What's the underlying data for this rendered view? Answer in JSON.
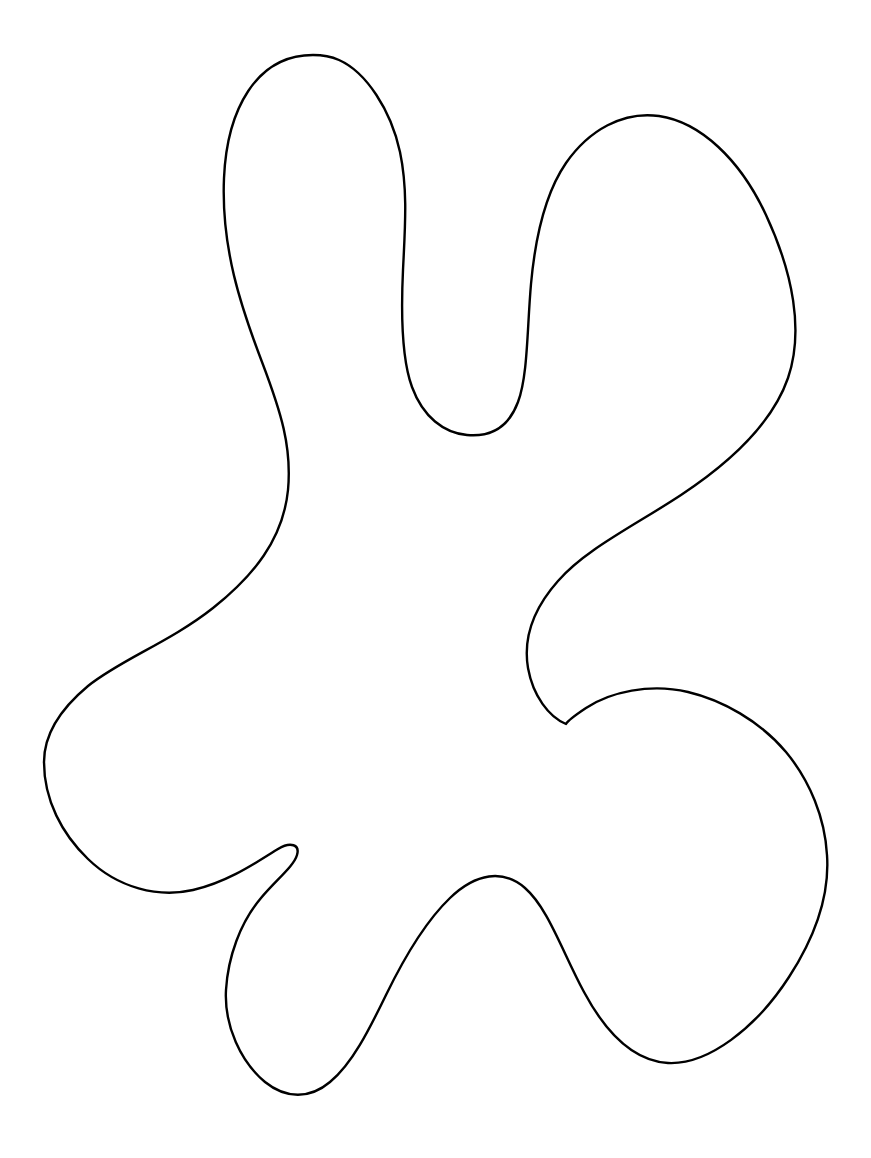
{
  "canvas": {
    "width": 871,
    "height": 1158,
    "background_color": "#ffffff",
    "title": "Blob Outline"
  },
  "artwork": {
    "name": "amoeba-blob-outline",
    "description": "Single closed freeform blob / splat outline drawing",
    "stroke_color": "#000000",
    "fill_color": "#ffffff",
    "stroke_width": 2.4,
    "shape_type": "closed-freeform-curve",
    "lobe_count": 5,
    "notch_count": 4,
    "bounding_box": {
      "x": 44,
      "y": 53,
      "width": 785,
      "height": 1045
    },
    "features": [
      {
        "name": "top-lobe",
        "kind": "lobe",
        "apex_x": 313,
        "apex_y": 55
      },
      {
        "name": "upper-right-lobe",
        "kind": "lobe",
        "apex_x": 630,
        "apex_y": 118
      },
      {
        "name": "central-notch",
        "kind": "notch",
        "apex_x": 467,
        "apex_y": 435
      },
      {
        "name": "right-middle-notch",
        "kind": "notch",
        "apex_x": 566,
        "apex_y": 724
      },
      {
        "name": "bottom-right-lobe",
        "kind": "lobe",
        "apex_x": 827,
        "apex_y": 855
      },
      {
        "name": "bottom-left-lobe",
        "kind": "lobe",
        "apex_x": 288,
        "apex_y": 1096
      },
      {
        "name": "narrow-hook-spike",
        "kind": "notch",
        "apex_x": 296,
        "apex_y": 849
      },
      {
        "name": "left-lobe",
        "kind": "lobe",
        "apex_x": 44,
        "apex_y": 762
      }
    ],
    "path_d": "M 313 55 C 256 55 227 110 224 178 C 221 248 241 307 262 362 C 281 412 292 447 288 490 C 283 540 253 576 213 608 C 170 642 120 660 88 686 C 52 716 44 742 44 762 C 44 800 62 834 88 859 C 118 888 158 898 193 890 C 228 882 257 862 278 849 C 291 841 300 845 297 855 C 294 866 276 880 261 898 C 240 923 228 957 226 990 C 224 1026 241 1062 265 1082 C 286 1099 310 1099 330 1082 C 352 1064 369 1030 386 995 C 404 958 426 921 450 898 C 476 873 503 869 525 888 C 548 908 562 951 584 992 C 606 1033 634 1061 668 1063 C 708 1065 756 1028 789 977 C 822 926 829 884 827 855 C 825 818 810 781 786 752 C 760 721 722 700 688 692 C 650 683 610 692 586 708 C 568 720 566 724 566 724 C 549 717 533 696 528 668 C 523 638 534 608 558 581 C 586 549 634 526 681 495 C 728 464 772 424 788 378 C 804 331 793 273 766 215 C 740 159 700 122 659 116 C 623 111 589 130 566 163 C 544 195 535 240 531 284 C 527 329 528 375 518 402 C 508 429 489 437 467 435 C 444 433 423 417 412 387 C 401 357 401 312 403 270 C 405 228 408 190 400 152 C 391 110 366 72 339 60 C 330 56 321 55 313 55 Z"
  }
}
